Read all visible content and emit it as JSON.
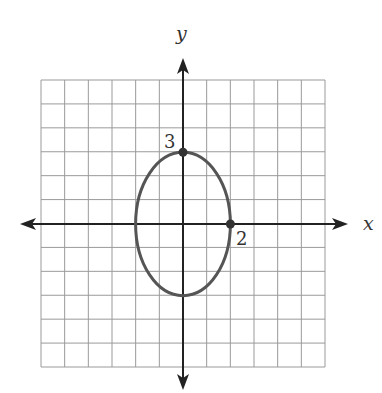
{
  "chart_data": {
    "type": "diagram",
    "title": "",
    "axes": {
      "x_label": "x",
      "y_label": "y",
      "x_range": [
        -6,
        6
      ],
      "y_range": [
        -6,
        6
      ],
      "grid": true,
      "grid_step": 1
    },
    "ellipse": {
      "center": [
        0,
        0
      ],
      "semi_axis_x": 2,
      "semi_axis_y": 3,
      "equation": "x^2/4 + y^2/9 = 1"
    },
    "marked_points": [
      {
        "x": 0,
        "y": 3,
        "label": "3"
      },
      {
        "x": 2,
        "y": 0,
        "label": "2"
      }
    ]
  },
  "labels": {
    "x_axis": "x",
    "y_axis": "y",
    "point_top": "3",
    "point_right": "2"
  },
  "colors": {
    "grid": "#9a9a9a",
    "axis": "#222222",
    "ellipse": "#555555"
  }
}
